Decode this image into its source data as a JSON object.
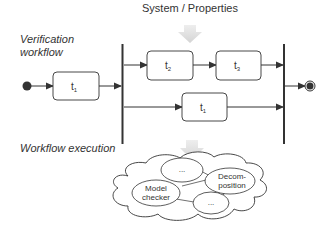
{
  "title": "System / Properties",
  "sections": {
    "verification_label_line1": "Verification",
    "verification_label_line2": "workflow",
    "execution_label": "Workflow execution"
  },
  "tasks": [
    {
      "id": "t1a",
      "base": "t",
      "sub": "1"
    },
    {
      "id": "t2",
      "base": "t",
      "sub": "2"
    },
    {
      "id": "t3",
      "base": "t",
      "sub": "3"
    },
    {
      "id": "t1b",
      "base": "t",
      "sub": "1"
    }
  ],
  "cloud_nodes": [
    {
      "id": "dots-top",
      "line1": "...",
      "line2": ""
    },
    {
      "id": "decomposition",
      "line1": "Decom-",
      "line2": "position"
    },
    {
      "id": "model-checker",
      "line1": "Model",
      "line2": "checker"
    },
    {
      "id": "dots-bottom",
      "line1": "...",
      "line2": ""
    }
  ],
  "colors": {
    "stroke": "#333333",
    "gray_arrow": "#d9d9d9",
    "background": "#ffffff"
  }
}
